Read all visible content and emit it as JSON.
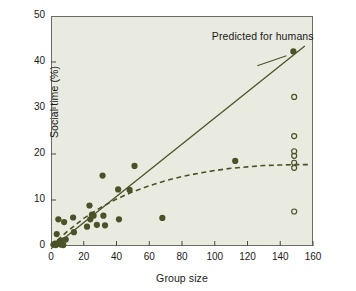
{
  "chart_data": {
    "type": "scatter",
    "title": "",
    "xlabel": "Group size",
    "ylabel": "Social time (%)",
    "xlim": [
      0,
      160
    ],
    "ylim": [
      0,
      50
    ],
    "xticks": [
      0,
      20,
      40,
      60,
      80,
      100,
      120,
      140,
      160
    ],
    "yticks": [
      0,
      10,
      20,
      30,
      40,
      50
    ],
    "grid": false,
    "legend": "none",
    "background_color": "#e9eae0",
    "marker_color": "#4b5228",
    "annotations": [
      {
        "text": "Predicted for humans",
        "x": 97,
        "y": 45.5,
        "points_to": {
          "x": 145,
          "y": 42.0
        }
      }
    ],
    "series": [
      {
        "name": "Primate species (observed)",
        "type": "scatter",
        "marker": "filled-circle",
        "color": "#4b5228",
        "points": [
          {
            "x": 1.5,
            "y": 0.3
          },
          {
            "x": 2.5,
            "y": 0.5
          },
          {
            "x": 3.0,
            "y": 0.2
          },
          {
            "x": 3.5,
            "y": 2.6
          },
          {
            "x": 4.0,
            "y": 0.6
          },
          {
            "x": 4.5,
            "y": 5.8
          },
          {
            "x": 5.5,
            "y": 1.0
          },
          {
            "x": 6.0,
            "y": 0.3
          },
          {
            "x": 7.0,
            "y": 1.2
          },
          {
            "x": 7.5,
            "y": 0.2
          },
          {
            "x": 8.0,
            "y": 5.2
          },
          {
            "x": 9.0,
            "y": 1.4
          },
          {
            "x": 13.5,
            "y": 6.2
          },
          {
            "x": 14.0,
            "y": 3.0
          },
          {
            "x": 22.0,
            "y": 4.2
          },
          {
            "x": 23.5,
            "y": 8.8
          },
          {
            "x": 24.0,
            "y": 5.8
          },
          {
            "x": 25.0,
            "y": 6.8
          },
          {
            "x": 26.0,
            "y": 6.6
          },
          {
            "x": 28.0,
            "y": 4.6
          },
          {
            "x": 31.5,
            "y": 15.3
          },
          {
            "x": 32.0,
            "y": 6.6
          },
          {
            "x": 33.0,
            "y": 4.5
          },
          {
            "x": 41.0,
            "y": 12.3
          },
          {
            "x": 41.5,
            "y": 5.8
          },
          {
            "x": 48.0,
            "y": 12.2
          },
          {
            "x": 51.0,
            "y": 17.4
          },
          {
            "x": 68.0,
            "y": 6.1
          },
          {
            "x": 112.5,
            "y": 18.5
          },
          {
            "x": 148.0,
            "y": 42.3
          }
        ]
      },
      {
        "name": "Human societies (observed)",
        "type": "scatter",
        "marker": "open-circle",
        "color": "#4b5228",
        "points": [
          {
            "x": 148.5,
            "y": 32.4
          },
          {
            "x": 148.5,
            "y": 23.9
          },
          {
            "x": 148.5,
            "y": 20.6
          },
          {
            "x": 148.5,
            "y": 19.6
          },
          {
            "x": 148.5,
            "y": 18.1
          },
          {
            "x": 148.5,
            "y": 17.0
          },
          {
            "x": 148.5,
            "y": 7.5
          }
        ]
      },
      {
        "name": "Linear prediction",
        "type": "line",
        "style": "solid",
        "color": "#4b5228",
        "x": [
          0,
          155
        ],
        "y": [
          -0.6,
          43.5
        ]
      },
      {
        "name": "Asymptotic fit",
        "type": "line",
        "style": "dashed",
        "color": "#4b5228",
        "x": [
          0,
          10,
          20,
          30,
          40,
          50,
          60,
          70,
          80,
          90,
          100,
          110,
          120,
          130,
          140,
          150,
          157
        ],
        "y": [
          0.0,
          3.2,
          6.0,
          8.3,
          10.2,
          11.8,
          13.1,
          14.2,
          15.1,
          15.8,
          16.4,
          16.9,
          17.2,
          17.5,
          17.6,
          17.7,
          17.7
        ]
      }
    ]
  },
  "axes": {
    "x_title": "Group size",
    "y_title": "Social time (%)",
    "x_tick_labels": [
      "0",
      "20",
      "40",
      "60",
      "80",
      "100",
      "120",
      "140",
      "160"
    ],
    "y_tick_labels": [
      "0",
      "10",
      "20",
      "30",
      "40",
      "50"
    ]
  },
  "annotation_label": "Predicted for humans"
}
